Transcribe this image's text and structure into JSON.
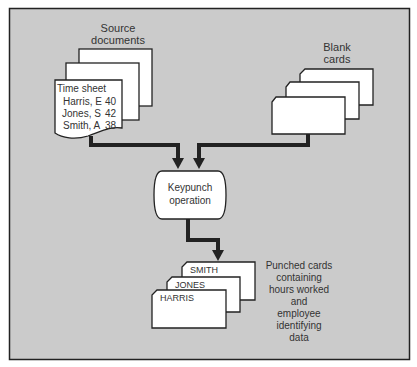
{
  "diagram": {
    "background": "#c9c9c9",
    "line_color": "#222222",
    "source": {
      "label_line1": "Source",
      "label_line2": "documents",
      "sheet_title": "Time sheet",
      "rows": [
        {
          "name": "Harris, E",
          "hours": "40"
        },
        {
          "name": "Jones, S",
          "hours": "42"
        },
        {
          "name": "Smith, A",
          "hours": "38"
        }
      ]
    },
    "blank": {
      "label_line1": "Blank",
      "label_line2": "cards"
    },
    "process": {
      "line1": "Keypunch",
      "line2": "operation"
    },
    "output": {
      "cards": [
        "SMITH",
        "JONES",
        "HARRIS"
      ],
      "description": [
        "Punched cards",
        "containing",
        "hours worked",
        "and",
        "employee",
        "identifying",
        "data"
      ]
    }
  }
}
